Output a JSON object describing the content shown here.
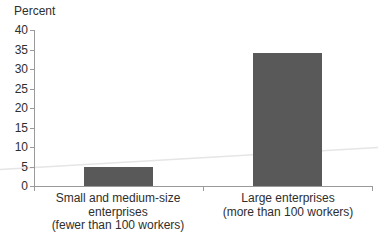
{
  "chart_data": {
    "type": "bar",
    "title": "",
    "ylabel": "Percent",
    "xlabel": "",
    "categories": [
      "Small and medium-size enterprises (fewer than 100 workers)",
      "Large enterprises (more than 100 workers)"
    ],
    "category_label_lines": [
      [
        "Small and medium-size",
        "enterprises",
        "(fewer than 100 workers)"
      ],
      [
        "Large enterprises",
        "(more than 100 workers)"
      ]
    ],
    "values": [
      5,
      34
    ],
    "ylim": [
      0,
      40
    ],
    "ytick_interval": 5,
    "ytick_labels": [
      "40",
      "35",
      "30",
      "25",
      "20",
      "15",
      "10",
      "5",
      "0"
    ],
    "grid": false,
    "legend": "none",
    "bar_color": "#595959",
    "axis_color": "#9a9a9a",
    "text_color": "#2e2e2e",
    "artifact_line_color": "#e5e5e5"
  }
}
